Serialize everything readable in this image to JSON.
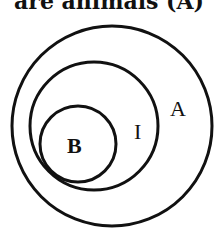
{
  "caption": "are animals (A)",
  "diagram": {
    "type": "nested-circles",
    "stroke_color": "#111111",
    "circles": [
      {
        "label": "A",
        "cx": 112,
        "cy": 126,
        "r": 100
      },
      {
        "label": "I",
        "cx": 94,
        "cy": 126,
        "r": 64
      },
      {
        "label": "B",
        "cx": 78,
        "cy": 144,
        "r": 38
      }
    ]
  }
}
